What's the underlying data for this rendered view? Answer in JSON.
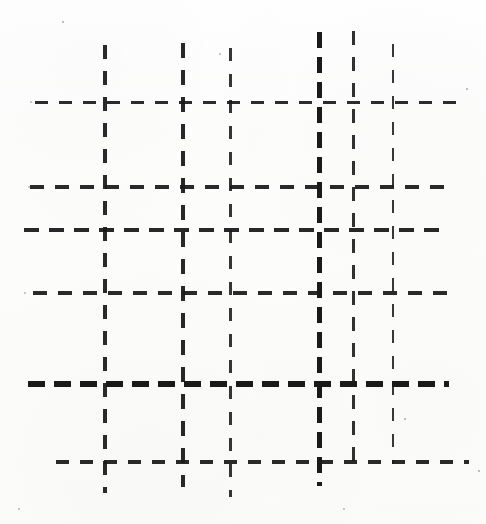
{
  "figure": {
    "kind": "dashed-grid-line-drawing",
    "description": "Scanned black-and-white figure of a grid formed by dashed horizontal and vertical lines of varying stroke weight",
    "canvas": {
      "width": 486,
      "height": 524
    },
    "background_color": "#fdfdfc",
    "ink_color": "#1a1a1a",
    "stroke_counts": {
      "horizontal": 6,
      "vertical": 6
    },
    "horizontal_lines": [
      {
        "id": "h1",
        "y": 102,
        "x_start": 35,
        "x_end": 461,
        "thickness": 3.0,
        "dash": 13,
        "gap": 11,
        "weight": "regular",
        "opacity": 0.92
      },
      {
        "id": "h2",
        "y": 187,
        "x_start": 30,
        "x_end": 447,
        "thickness": 3.2,
        "dash": 14,
        "gap": 11,
        "weight": "regular",
        "opacity": 0.93
      },
      {
        "id": "h3",
        "y": 230,
        "x_start": 24,
        "x_end": 441,
        "thickness": 3.4,
        "dash": 15,
        "gap": 10,
        "weight": "regular",
        "opacity": 0.94
      },
      {
        "id": "h4",
        "y": 293,
        "x_start": 33,
        "x_end": 448,
        "thickness": 3.2,
        "dash": 14,
        "gap": 11,
        "weight": "regular",
        "opacity": 0.93
      },
      {
        "id": "h5",
        "y": 384,
        "x_start": 28,
        "x_end": 449,
        "thickness": 5.2,
        "dash": 17,
        "gap": 9,
        "weight": "bold",
        "opacity": 1.0
      },
      {
        "id": "h6",
        "y": 462,
        "x_start": 56,
        "x_end": 469,
        "thickness": 3.2,
        "dash": 13,
        "gap": 11,
        "weight": "regular",
        "opacity": 0.93
      }
    ],
    "vertical_lines": [
      {
        "id": "v1",
        "x": 105,
        "y_start": 45,
        "y_end": 493,
        "thickness": 3.2,
        "dash": 14,
        "gap": 12,
        "weight": "regular",
        "opacity": 0.93
      },
      {
        "id": "v2",
        "x": 183,
        "y_start": 43,
        "y_end": 487,
        "thickness": 3.4,
        "dash": 15,
        "gap": 12,
        "weight": "regular",
        "opacity": 0.94
      },
      {
        "id": "v3",
        "x": 230,
        "y_start": 48,
        "y_end": 497,
        "thickness": 3.0,
        "dash": 13,
        "gap": 13,
        "weight": "light",
        "opacity": 0.88
      },
      {
        "id": "v4",
        "x": 319,
        "y_start": 32,
        "y_end": 486,
        "thickness": 5.0,
        "dash": 16,
        "gap": 9,
        "weight": "bold",
        "opacity": 1.0
      },
      {
        "id": "v5",
        "x": 353,
        "y_start": 31,
        "y_end": 470,
        "thickness": 3.0,
        "dash": 14,
        "gap": 12,
        "weight": "regular",
        "opacity": 0.9
      },
      {
        "id": "v6",
        "x": 393,
        "y_start": 44,
        "y_end": 464,
        "thickness": 2.8,
        "dash": 13,
        "gap": 13,
        "weight": "light",
        "opacity": 0.87
      }
    ],
    "specks": [
      {
        "x": 28,
        "y": 186,
        "size": 2.4
      },
      {
        "x": 24,
        "y": 292,
        "size": 2.2
      },
      {
        "x": 30,
        "y": 101,
        "size": 1.8
      },
      {
        "x": 219,
        "y": 53,
        "size": 2.0
      },
      {
        "x": 466,
        "y": 88,
        "size": 1.6
      },
      {
        "x": 18,
        "y": 508,
        "size": 1.8
      },
      {
        "x": 404,
        "y": 418,
        "size": 1.6
      },
      {
        "x": 62,
        "y": 21,
        "size": 1.5
      },
      {
        "x": 343,
        "y": 508,
        "size": 2.0
      },
      {
        "x": 478,
        "y": 470,
        "size": 1.5
      }
    ]
  }
}
